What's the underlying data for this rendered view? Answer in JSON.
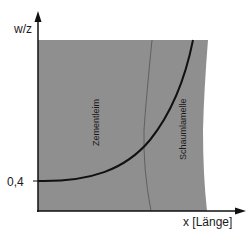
{
  "diagram": {
    "y_axis": {
      "label": "w/z",
      "tick_label": "0,4"
    },
    "x_axis": {
      "label": "x [Länge]"
    },
    "regions": [
      {
        "name": "zementleim",
        "label": "Zementleim"
      },
      {
        "name": "schaumlamelle",
        "label": "Schaumlamelle"
      }
    ],
    "colors": {
      "region_fill": "#8f8f8f",
      "axis": "#111111",
      "curve": "#111111",
      "boundary_line": "#5a5a5a",
      "background": "#ffffff"
    }
  }
}
